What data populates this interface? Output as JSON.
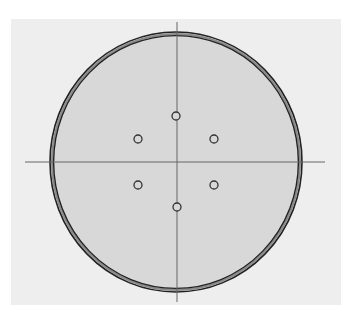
{
  "diagram": {
    "type": "circular-plate-with-holes",
    "background_color": "#eeeeee",
    "plate": {
      "center": [
        176,
        162
      ],
      "rx": 126,
      "ry": 130,
      "fill": "#d8d8d8",
      "rim_color": "#222222",
      "rim_band_color": "#8a8a8a"
    },
    "crosshair": {
      "color": "#666666",
      "horizontal": {
        "x1": 25,
        "x2": 325,
        "y": 162
      },
      "vertical": {
        "x": 177,
        "y1": 22,
        "y2": 302
      }
    },
    "holes": [
      {
        "name": "top",
        "cx": 176,
        "cy": 116
      },
      {
        "name": "upper-left",
        "cx": 138,
        "cy": 139
      },
      {
        "name": "upper-right",
        "cx": 214,
        "cy": 139
      },
      {
        "name": "lower-left",
        "cx": 138,
        "cy": 185
      },
      {
        "name": "lower-right",
        "cx": 214,
        "cy": 185
      },
      {
        "name": "bottom",
        "cx": 177,
        "cy": 207
      }
    ],
    "hole_radius": 4
  }
}
